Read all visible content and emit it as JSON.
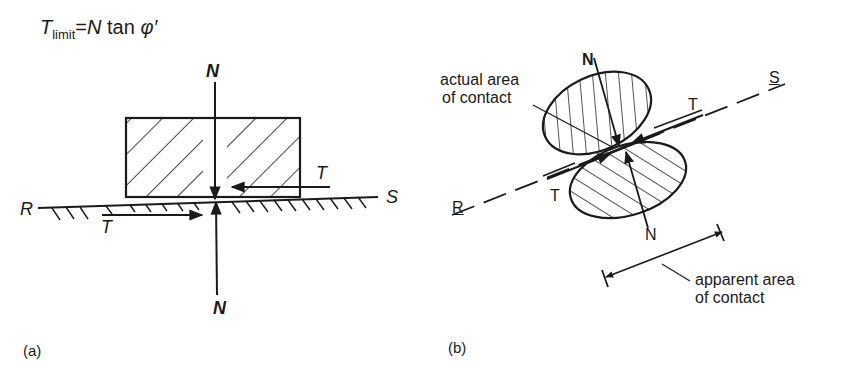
{
  "formula": {
    "T": "T",
    "subscript": "limit",
    "equals": "=",
    "N": "N",
    "tan": " tan ",
    "phi": "φ′"
  },
  "panel_a": {
    "caption": "(a)",
    "labels": {
      "N_top": "N",
      "N_bottom": "N",
      "T_upper": "T",
      "T_lower": "T",
      "R": "R",
      "S": "S"
    }
  },
  "panel_b": {
    "caption": "(b)",
    "labels": {
      "N_top": "N",
      "N_bottom": "N",
      "T_upper": "T",
      "T_lower": "T",
      "R": "R",
      "S": "S"
    },
    "annotations": {
      "actual_line1": "actual area",
      "actual_line2": "of contact",
      "apparent_line1": "apparent area",
      "apparent_line2": "of contact"
    }
  },
  "colors": {
    "ink": "#1a1a1a",
    "background": "#ffffff"
  }
}
